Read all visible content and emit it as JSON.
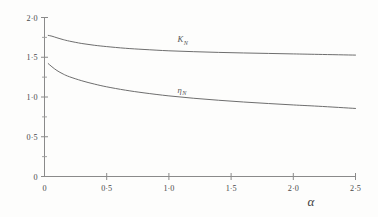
{
  "figure": {
    "background": "#fdfdfc",
    "ink_color": "#6e6e6e",
    "axis_color": "#8a8a8a"
  },
  "chart_data": {
    "type": "line",
    "title": "",
    "subtitle": "",
    "xlabel": "α",
    "ylabel": "",
    "xlim": [
      0,
      2.5
    ],
    "ylim": [
      0,
      2.0
    ],
    "grid": false,
    "legend": "inline-labels",
    "x_ticks": [
      0,
      0.5,
      1.0,
      1.5,
      2.0,
      2.5
    ],
    "x_tick_labels": [
      "0",
      "0·5",
      "1·0",
      "1·5",
      "2·0",
      "2·5"
    ],
    "x_minor_ticks": [
      0.25,
      0.75,
      1.25,
      1.75,
      2.25
    ],
    "y_ticks": [
      0,
      0.5,
      1.0,
      1.5,
      2.0
    ],
    "y_tick_labels": [
      "0",
      "0·5",
      "1·0",
      "1·5",
      "2·0"
    ],
    "y_minor_ticks": [
      0.25,
      0.75,
      1.25,
      1.75
    ],
    "series": [
      {
        "name": "K_N",
        "label": "K",
        "label_subscript": "N",
        "label_x": 1.07,
        "label_y": 1.69,
        "color": "#6e6e6e",
        "x": [
          0.03,
          0.06,
          0.1,
          0.15,
          0.2,
          0.3,
          0.4,
          0.5,
          0.65,
          0.8,
          1.0,
          1.2,
          1.4,
          1.6,
          1.8,
          2.0,
          2.2,
          2.5
        ],
        "y": [
          1.775,
          1.765,
          1.745,
          1.722,
          1.703,
          1.673,
          1.651,
          1.634,
          1.613,
          1.598,
          1.581,
          1.57,
          1.561,
          1.554,
          1.548,
          1.542,
          1.536,
          1.527
        ]
      },
      {
        "name": "eta_N",
        "label": "η",
        "label_subscript": "N",
        "label_x": 1.07,
        "label_y": 1.055,
        "color": "#6e6e6e",
        "x": [
          0.03,
          0.06,
          0.1,
          0.15,
          0.2,
          0.3,
          0.4,
          0.5,
          0.65,
          0.8,
          1.0,
          1.2,
          1.4,
          1.6,
          1.8,
          2.0,
          2.2,
          2.5
        ],
        "y": [
          1.42,
          1.38,
          1.333,
          1.289,
          1.255,
          1.204,
          1.163,
          1.128,
          1.086,
          1.052,
          1.014,
          0.984,
          0.959,
          0.937,
          0.918,
          0.9,
          0.884,
          0.856
        ]
      }
    ]
  }
}
